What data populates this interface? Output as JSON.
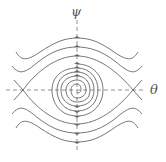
{
  "diagram": {
    "type": "phase-portrait",
    "axes": {
      "x_label": "θ",
      "y_label": "ψ"
    },
    "colors": {
      "curve": "#666666",
      "axis": "#777777",
      "background": "#ffffff"
    },
    "equilibria": [
      {
        "type": "stable-spiral",
        "position": "origin"
      },
      {
        "type": "saddle",
        "position": "-π"
      },
      {
        "type": "saddle",
        "position": "+π"
      }
    ]
  }
}
